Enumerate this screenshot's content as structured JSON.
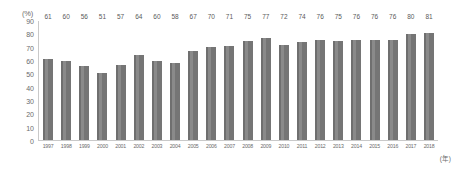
{
  "chart_data": {
    "type": "bar",
    "title": "",
    "subtitle": "",
    "xlabel": "(年)",
    "ylabel": "(%)",
    "ylim": [
      0,
      90
    ],
    "y_ticks": [
      0,
      10,
      20,
      30,
      40,
      50,
      60,
      70,
      80,
      90
    ],
    "grid": false,
    "legend": null,
    "bar_color": "#7d7d7d",
    "axis_color": "#c9c9c9",
    "text_color": "#6b6b6b",
    "categories": [
      "1997",
      "1998",
      "1999",
      "2000",
      "2001",
      "2002",
      "2003",
      "2004",
      "2005",
      "2006",
      "2007",
      "2008",
      "2009",
      "2010",
      "2011",
      "2012",
      "2013",
      "2014",
      "2015",
      "2016",
      "2017",
      "2018"
    ],
    "values": [
      61,
      60,
      56,
      51,
      57,
      64,
      60,
      58,
      67,
      70,
      71,
      75,
      77,
      72,
      74,
      76,
      75,
      76,
      76,
      76,
      80,
      81
    ]
  }
}
